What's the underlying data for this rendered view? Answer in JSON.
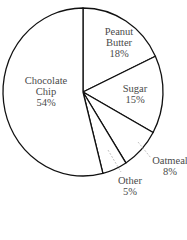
{
  "chart_data": {
    "type": "pie",
    "title": "",
    "title_note": "title cropped at top edge of image; not legible",
    "start_angle_deg": 0,
    "direction": "clockwise",
    "categories": [
      "Peanut Butter",
      "Sugar",
      "Oatmeal",
      "Other",
      "Chocolate Chip"
    ],
    "values": [
      18,
      15,
      8,
      5,
      54
    ],
    "unit": "%",
    "labels": [
      {
        "name_lines": [
          "Peanut",
          "Butter"
        ],
        "pct": "18%",
        "inside": true
      },
      {
        "name_lines": [
          "Sugar"
        ],
        "pct": "15%",
        "inside": true
      },
      {
        "name_lines": [
          "Oatmeal"
        ],
        "pct": "8%",
        "inside": false
      },
      {
        "name_lines": [
          "Other"
        ],
        "pct": "5%",
        "inside": false
      },
      {
        "name_lines": [
          "Chocolate",
          "Chip"
        ],
        "pct": "54%",
        "inside": true
      }
    ],
    "fill_color": "#ffffff",
    "stroke_color": "#111111",
    "leader_color": "#bbbbbb",
    "legend": "none",
    "grid": false
  },
  "geometry": {
    "cx": 83,
    "cy": 92,
    "rx": 80,
    "ry": 84
  },
  "labels": {
    "peanut_butter": {
      "line1": "Peanut",
      "line2": "Butter",
      "pct": "18%"
    },
    "sugar": {
      "line1": "Sugar",
      "pct": "15%"
    },
    "oatmeal": {
      "line1": "Oatmeal",
      "pct": "8%"
    },
    "other": {
      "line1": "Other",
      "pct": "5%"
    },
    "chocolate_chip": {
      "line1": "Chocolate",
      "line2": "Chip",
      "pct": "54%"
    }
  }
}
